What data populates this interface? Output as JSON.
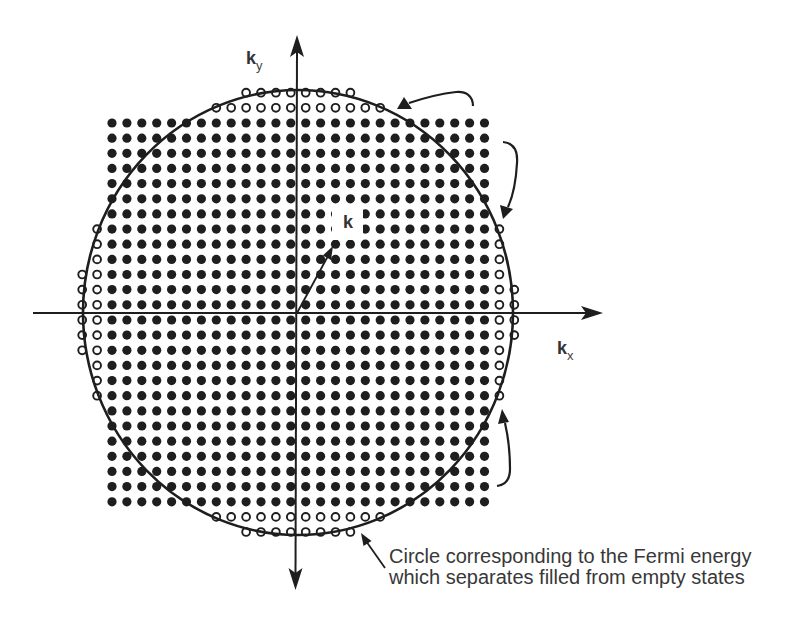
{
  "figure": {
    "axis_labels": {
      "ky": {
        "main": "k",
        "sub": "y"
      },
      "kx": {
        "main": "k",
        "sub": "x"
      }
    },
    "vector_label": "k",
    "caption": {
      "line1": "Circle corresponding to the Fermi energy",
      "line2": "which separates filled from empty states"
    }
  },
  "lattice": {
    "cols": 26,
    "rows": 26,
    "x0": 112,
    "y0": 123,
    "dx": 14.9,
    "dy": 15.15,
    "margin": 2,
    "filled_radius": 4.6,
    "open_radius": 3.9,
    "open_threshold": 1.02,
    "filled_meaning": "filled states inside square grid",
    "open_meaning": "empty states inside Fermi circle"
  },
  "fermi_circle": {
    "cx": 298,
    "cy": 312.5,
    "rx": 215,
    "ry": 222.5
  },
  "colors": {
    "ink": "#1e1e1e",
    "text": "#383838",
    "background": "#ffffff"
  }
}
